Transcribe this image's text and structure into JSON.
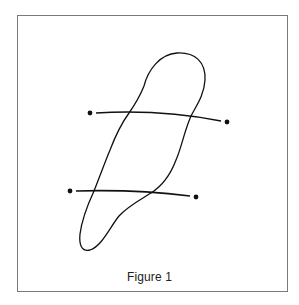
{
  "figure": {
    "caption": "Figure 1",
    "frame_color": "#7a7a7a",
    "stroke_color": "#111111",
    "closed_curve": {
      "description": "elongated closed loop tilted from lower-left to upper-right"
    },
    "lines": [
      {
        "name": "upper-line",
        "start_point": {
          "x": 90,
          "y": 113
        },
        "end_point": {
          "x": 227,
          "y": 122
        }
      },
      {
        "name": "lower-line",
        "start_point": {
          "x": 70,
          "y": 191
        },
        "end_point": {
          "x": 196,
          "y": 197
        }
      }
    ]
  }
}
